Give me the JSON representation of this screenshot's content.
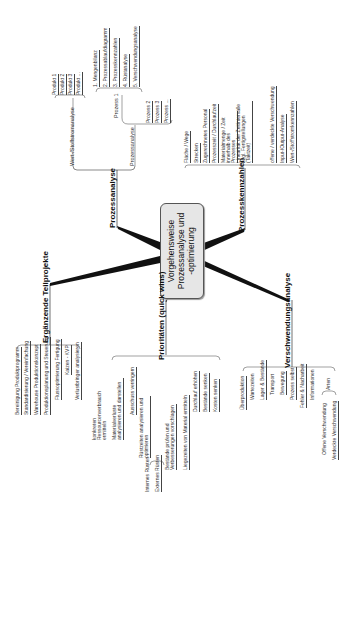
{
  "center": {
    "line1": "Vorgehensweise",
    "line2": "Prozessanalyse und",
    "line3": "-optimierung"
  },
  "branches": {
    "prozessanalyse": {
      "label": "Prozessanalyse",
      "wert_stoffstrom": {
        "label": "Wert-/Stoffstromanalyse",
        "items": [
          "Produkt 1",
          "Produkt 2",
          "Produkt 3",
          "Produkt ..."
        ]
      },
      "prozessanalyse_sub": {
        "label": "Prozessanalyse",
        "prozess1": {
          "label": "Prozess 1",
          "steps": [
            "1. Mengenbilanz",
            "2. Prozessablaufdiagramm",
            "3. Prozesskennzahlen",
            "4. Rüstanalyse",
            "5. Verschwendungsanalyse"
          ]
        },
        "other_processes": [
          "Prozess 2",
          "Prozess 3",
          "Prozess ..."
        ]
      }
    },
    "prozesskennzahlen": {
      "label": "Prozesskennzahlen",
      "items": [
        "Fläche / Wege",
        "Strecken",
        "Zugerechnetes Personal",
        "Prozesszeit / Durchlaufzeit",
        "Materialmenge / Zeit innerhalb des Prozesses",
        "Linearität der Zeitintervalle bzgl. Fertigstellungen (Taktzeit)",
        "offene / verdeckte Verschwendung",
        "Input-/Output-Analyse",
        "Wert-/Stoffstromkennzahlen"
      ]
    },
    "ergaenzende": {
      "label": "Ergänzende Teilprojekte",
      "items": [
        "Bereinigung Produktprogramm",
        "Standardisierung / Vereinfachung",
        "Warehouse Produktionskonzept",
        "Produktionsplanung und Steuerung",
        "Flussoptimierung Fertigung",
        "Kaizen - KVP",
        "Verlustbringer analysieren"
      ]
    },
    "prioritaeten": {
      "label": "Prioritäten (quick wins)",
      "items": [
        "konkreten Ressourcenverbrauch ermitteln",
        "Materialverluste analysieren und darstellen",
        "Ausschuss verringern",
        "Rüstzeiten analysieren und optimieren",
        "Bestände prüfen und Verbesserungen vorschlagen",
        "Liegezeiten von Material ermitteln",
        "Durchlauf erhöhen",
        "Bestände senken",
        "Kosten senken"
      ],
      "ruesten_sub": [
        "Internes Rüsten",
        "Externes Rüsten"
      ]
    },
    "verschwendung": {
      "label": "Verschwendungsanalyse",
      "items": [
        "Überproduktion",
        "Wartezeiten",
        "Lager & Bestände",
        "Transport",
        "Bewegung",
        "Prozess selbst",
        "Fehler & Nacharbeit",
        "Informationen",
        "Arten"
      ],
      "arten_sub": [
        "Offene Verschwendung",
        "Verdeckte Verschwendung"
      ]
    }
  },
  "colors": {
    "center_fill": "#e6e6e6",
    "line": "#111111",
    "text": "#222222"
  }
}
